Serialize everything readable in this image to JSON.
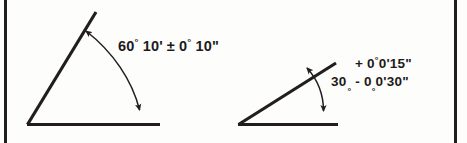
{
  "figure": {
    "name": "angular-tolerance-dimensioning-figure",
    "background_color": "#fdfdfc",
    "line_color": "#221d1e",
    "text_color": "#1d1a1a",
    "border": {
      "left_rule_x": 4,
      "right_rule_x": 454,
      "rule_width": 3,
      "color": "#221d1e"
    }
  },
  "diagrams": [
    {
      "id": "left-angle-diagram",
      "name": "sixty-degree-angle-diagram",
      "vertex": {
        "x": 27,
        "y": 124
      },
      "base_line": {
        "x1": 27,
        "y1": 124,
        "x2": 160,
        "y2": 124
      },
      "inclined_line": {
        "x1": 27,
        "y1": 124,
        "x2": 96,
        "y2": 12
      },
      "dimension_arc": {
        "start": {
          "x": 86,
          "y": 31
        },
        "end": {
          "x": 140,
          "y": 112
        },
        "double_headed": true
      },
      "nominal_angle": "60° 10'",
      "tolerance": "± 0° 10\"",
      "label_text": "60° 10' ± 0° 10\"",
      "label": {
        "nominal_value": "60",
        "degree_symbol": "°",
        "minutes_value": "10",
        "minutes_symbol": "'",
        "plusminus_symbol": "±",
        "tolerance_degrees": "0",
        "tolerance_degree_symbol": "°",
        "tolerance_seconds": "10",
        "seconds_symbol": "\""
      }
    },
    {
      "id": "right-angle-diagram",
      "name": "thirty-degree-angle-diagram",
      "vertex": {
        "x": 238,
        "y": 124
      },
      "base_line": {
        "x1": 238,
        "y1": 124,
        "x2": 338,
        "y2": 124
      },
      "inclined_line": {
        "x1": 238,
        "y1": 124,
        "x2": 336,
        "y2": 63
      },
      "dimension_arc": {
        "start": {
          "x": 306,
          "y": 67
        },
        "end": {
          "x": 323,
          "y": 113
        },
        "double_headed": true
      },
      "nominal_angle": "30°",
      "tolerance_upper": "+ 0°0'15\"",
      "tolerance_lower": "- 0°0'30\"",
      "label_text": "30° +0°0'15\" / -0°0'30\"",
      "label": {
        "nominal_value": "30",
        "degree_symbol": "°",
        "upper_sign": "+",
        "upper_degrees": "0",
        "upper_minutes": "0",
        "upper_minutes_symbol": "'",
        "upper_seconds": "15",
        "seconds_symbol": "\"",
        "lower_sign": "-",
        "lower_degrees": "0",
        "lower_minutes": "0",
        "lower_minutes_symbol": "'",
        "lower_seconds": "30"
      }
    }
  ]
}
